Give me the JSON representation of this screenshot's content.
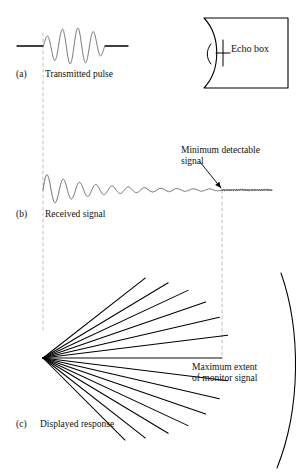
{
  "figure": {
    "width": 306,
    "height": 475,
    "background_color": "#ffffff",
    "ink_color": "#000000",
    "guide_color": "#b9b9b9"
  },
  "panels": {
    "a": {
      "tag": "(a)",
      "caption": "Transmitted pulse"
    },
    "b": {
      "tag": "(b)",
      "caption": "Received signal"
    },
    "c": {
      "tag": "(c)",
      "caption": "Displayed response"
    }
  },
  "annotations": {
    "minimum_detectable_signal": "Minimum detectable\nsignal",
    "maximum_extent": "Maximum extent\nof monitor signal"
  },
  "echo_box": {
    "label": "Echo box"
  },
  "chart_data": {
    "type": "line",
    "panels": [
      {
        "id": "a",
        "name": "Transmitted pulse",
        "type": "line",
        "description": "Flat baseline, a short burst of about 4 high-amplitude sine cycles, then flat baseline.",
        "baseline_y": 46,
        "x_start": 17,
        "x_end": 128,
        "burst_x_start": 43,
        "burst_x_end": 105,
        "cycles": 4,
        "peak_amplitude": 18
      },
      {
        "id": "b",
        "name": "Received signal",
        "type": "line",
        "description": "Exponentially decaying sinusoid starting at the transmit instant and decaying into a flat noise floor at the minimum detectable signal level.",
        "baseline_y": 190,
        "x_start": 43,
        "x_end": 272,
        "initial_amplitude": 16,
        "decay_end_x": 222,
        "noise_floor_amplitude": 1.2,
        "cycles": 11
      },
      {
        "id": "c",
        "name": "Displayed response",
        "type": "scatter",
        "description": "PPI style radial fan of straight rays from an apex; ray length is greatest along the horizontal centre ray and shortest at the angular extremes.",
        "apex_x": 43,
        "apex_y": 358,
        "rays": [
          {
            "angle_deg": -38,
            "length": 130
          },
          {
            "angle_deg": -31,
            "length": 146
          },
          {
            "angle_deg": -25,
            "length": 160
          },
          {
            "angle_deg": -19,
            "length": 172
          },
          {
            "angle_deg": -13,
            "length": 181
          },
          {
            "angle_deg": -7,
            "length": 186
          },
          {
            "angle_deg": 0,
            "length": 179
          },
          {
            "angle_deg": 7,
            "length": 186
          },
          {
            "angle_deg": 13,
            "length": 181
          },
          {
            "angle_deg": 19,
            "length": 172
          },
          {
            "angle_deg": 25,
            "length": 160
          },
          {
            "angle_deg": 31,
            "length": 146
          },
          {
            "angle_deg": 38,
            "length": 130
          },
          {
            "angle_deg": 45,
            "length": 116
          }
        ]
      }
    ],
    "guides": [
      {
        "name": "transmit-instant",
        "x": 43,
        "y_top": 33,
        "y_bottom": 330
      },
      {
        "name": "maximum-extent",
        "x": 222,
        "y_top": 190,
        "y_bottom": 358
      }
    ],
    "xlabel": "",
    "ylabel": "",
    "grid": false,
    "legend": "none"
  }
}
